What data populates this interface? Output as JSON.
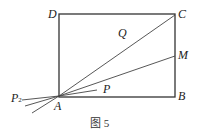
{
  "figure": {
    "caption": "图 5",
    "points": {
      "A": "A",
      "B": "B",
      "C": "C",
      "D": "D",
      "M": "M",
      "P": "P",
      "Q": "Q",
      "P2": "P",
      "P2_sub": "2"
    }
  }
}
